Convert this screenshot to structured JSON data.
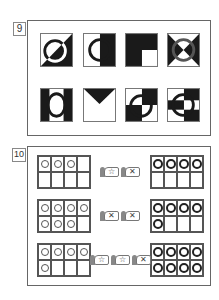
{
  "problems": [
    {
      "number": "9",
      "tiles": [
        {
          "id": "diagonal-split-circle"
        },
        {
          "id": "vertical-split-circle"
        },
        {
          "id": "black-with-white-corner"
        },
        {
          "id": "hourglass-circle"
        },
        {
          "id": "side-bars-circle"
        },
        {
          "id": "downward-triangle"
        },
        {
          "id": "checker-circle"
        },
        {
          "id": "checker-offset-circle"
        }
      ]
    },
    {
      "number": "10",
      "rows": [
        {
          "left_count": 3,
          "cards": [
            "☆",
            "✕"
          ],
          "right_count": 4
        },
        {
          "left_count": 7,
          "cards": [
            "✕",
            "✕"
          ],
          "right_count": 5
        },
        {
          "left_count": 5,
          "cards": [
            "☆",
            "☆",
            "✕"
          ],
          "right_count": 8
        }
      ]
    }
  ],
  "colors": {
    "ink": "#1a1a1a",
    "frame": "#666666",
    "paper": "#ffffff"
  }
}
